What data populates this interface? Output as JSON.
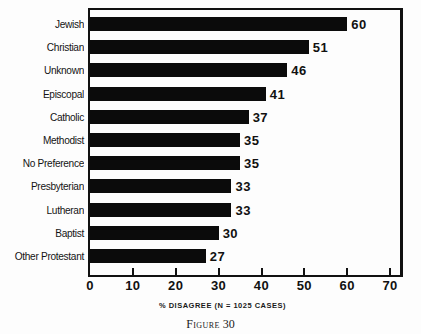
{
  "figure": {
    "caption_word": "Figure",
    "caption_number": "30",
    "axis_title": "% DISAGREE (N = 1025 CASES)"
  },
  "colors": {
    "bar": "#0b0b0b",
    "frame": "#111111",
    "background": "#fdfdfd",
    "text": "#141414"
  },
  "chart_data": {
    "type": "bar",
    "orientation": "horizontal",
    "title": "",
    "subtitle": "",
    "xlabel": "% DISAGREE (N = 1025 CASES)",
    "ylabel": "",
    "xlim": [
      0,
      73
    ],
    "xticks": [
      0,
      10,
      20,
      30,
      40,
      50,
      60,
      70
    ],
    "xtick_labels": [
      "0",
      "10",
      "20",
      "30",
      "40",
      "50",
      "60",
      "70"
    ],
    "grid": false,
    "legend": false,
    "categories": [
      "Jewish",
      "Christian",
      "Unknown",
      "Episcopal",
      "Catholic",
      "Methodist",
      "No Preference",
      "Presbyterian",
      "Lutheran",
      "Baptist",
      "Other Protestant"
    ],
    "values": [
      60,
      51,
      46,
      41,
      37,
      35,
      35,
      33,
      33,
      30,
      27
    ],
    "data_labels": [
      "60",
      "51",
      "46",
      "41",
      "37",
      "35",
      "35",
      "33",
      "33",
      "30",
      "27"
    ],
    "n_cases": 1025
  }
}
